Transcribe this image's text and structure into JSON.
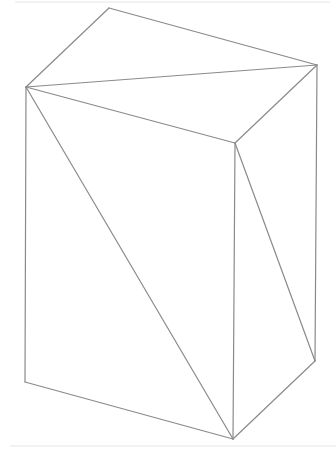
{
  "diagram": {
    "type": "wireframe-box-with-face-diagonals",
    "vertices": {
      "top_back": [
        109,
        8
      ],
      "left_top": [
        26,
        87
      ],
      "right_top": [
        317,
        65
      ],
      "front_top": [
        235,
        143
      ],
      "left_bottom": [
        25,
        382
      ],
      "front_bottom": [
        233,
        439
      ],
      "right_bottom": [
        315,
        361
      ]
    },
    "edges": [
      [
        "top_back",
        "left_top"
      ],
      [
        "top_back",
        "right_top"
      ],
      [
        "left_top",
        "right_top"
      ],
      [
        "left_top",
        "front_top"
      ],
      [
        "front_top",
        "right_top"
      ],
      [
        "left_top",
        "left_bottom"
      ],
      [
        "front_top",
        "front_bottom"
      ],
      [
        "right_top",
        "right_bottom"
      ],
      [
        "left_bottom",
        "front_bottom"
      ],
      [
        "front_bottom",
        "right_bottom"
      ],
      [
        "left_top",
        "front_bottom"
      ],
      [
        "front_top",
        "right_bottom"
      ]
    ],
    "colors": {
      "line": "#8a8a8a",
      "background": "#ffffff",
      "faint_rule": "#e6e6e6"
    }
  }
}
